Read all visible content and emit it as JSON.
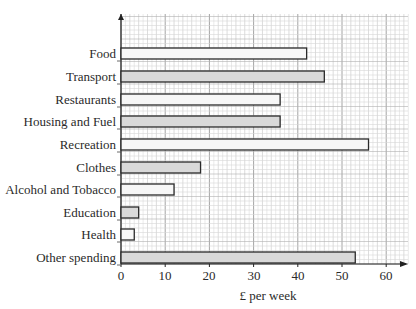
{
  "chart_data": {
    "type": "bar",
    "orientation": "horizontal",
    "title": "",
    "xlabel": "£ per week",
    "ylabel": "",
    "categories": [
      "Food",
      "Transport",
      "Restaurants",
      "Housing and Fuel",
      "Recreation",
      "Clothes",
      "Alcohol and Tobacco",
      "Education",
      "Health",
      "Other spending"
    ],
    "values": [
      42,
      46,
      36,
      36,
      56,
      18,
      12,
      4,
      3,
      53
    ],
    "bar_fills": [
      "#f7f7f7",
      "#d9d9d9",
      "#f7f7f7",
      "#d9d9d9",
      "#f7f7f7",
      "#d9d9d9",
      "#f7f7f7",
      "#d9d9d9",
      "#f7f7f7",
      "#d9d9d9"
    ],
    "xticks": [
      0,
      10,
      20,
      30,
      40,
      50,
      60
    ],
    "xlim": [
      0,
      65
    ],
    "grid": true,
    "grid_minor_step": 2,
    "legend": null
  },
  "labels": {
    "xlabel": "£ per week",
    "categories": [
      "Food",
      "Transport",
      "Restaurants",
      "Housing and Fuel",
      "Recreation",
      "Clothes",
      "Alcohol and Tobacco",
      "Education",
      "Health",
      "Other spending"
    ],
    "ticks": [
      "0",
      "10",
      "20",
      "30",
      "40",
      "50",
      "60"
    ]
  }
}
